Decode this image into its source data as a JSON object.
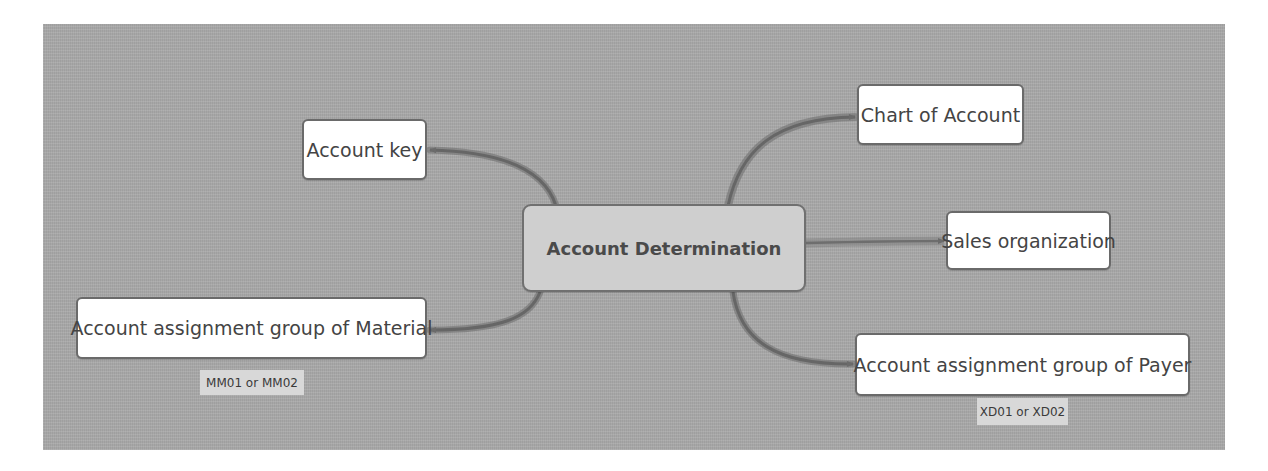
{
  "diagram": {
    "type": "mind-map",
    "central": {
      "label": "Account Determination"
    },
    "branches": [
      {
        "id": "account-key",
        "label": "Account key",
        "side": "left"
      },
      {
        "id": "account-assignment-group-material",
        "label": "Account assignment group of Material",
        "side": "left",
        "note": "MM01 or MM02"
      },
      {
        "id": "chart-of-account",
        "label": "Chart of Account",
        "side": "right"
      },
      {
        "id": "sales-organization",
        "label": "Sales organization",
        "side": "right"
      },
      {
        "id": "account-assignment-group-payer",
        "label": "Account assignment group of Payer",
        "side": "right",
        "note": "XD01 or XD02"
      }
    ],
    "colors": {
      "background": "#a9a9a9",
      "node_fill": "#ffffff",
      "central_fill": "#cfcfcf",
      "node_border": "#6a6a6a",
      "connector": "#6b6b6b",
      "note_fill": "#d8d8d8"
    }
  }
}
